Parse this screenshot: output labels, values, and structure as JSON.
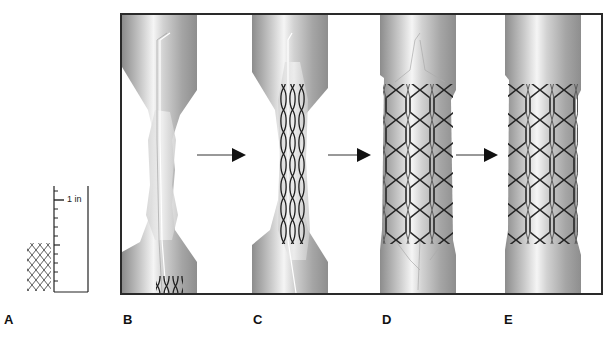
{
  "figure": {
    "panels": [
      {
        "id": "A",
        "label": "A",
        "description": "Unexpanded stent next to scale ruler"
      },
      {
        "id": "B",
        "label": "B",
        "description": "Stenosed vessel with guidewire and crimped stent entering"
      },
      {
        "id": "C",
        "label": "C",
        "description": "Crimped stent positioned across stenosis"
      },
      {
        "id": "D",
        "label": "D",
        "description": "Stent expanded, pressing plaque against vessel wall"
      },
      {
        "id": "E",
        "label": "E",
        "description": "Expanded stent in place, guidewire removed"
      }
    ],
    "ruler": {
      "unit_label": "1 in",
      "tick_count": 12
    },
    "arrows": [
      {
        "from": "B",
        "to": "C"
      },
      {
        "from": "C",
        "to": "D"
      },
      {
        "from": "D",
        "to": "E"
      }
    ],
    "colors": {
      "frame": "#2a2a2a",
      "vessel_dark": "#8a8a8a",
      "vessel_light": "#f2f2f2",
      "stent_wire": "#1e1e1e",
      "arrow": "#111111"
    }
  }
}
